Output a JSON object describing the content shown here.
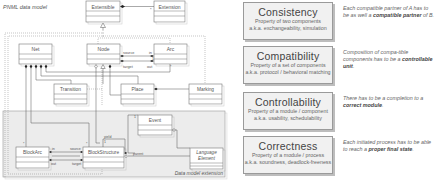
{
  "diagram": {
    "title": "PNML data model",
    "extension_label": "Data model extension",
    "classes": {
      "extensible": "Extensible",
      "extension": "Extension",
      "net": "Net",
      "node": "Node",
      "arc": "Arc",
      "transition": "Transition",
      "place": "Place",
      "marking": "Marking",
      "event": "Event",
      "block_arc": "BlockArc",
      "block_structure": "BlockStructure",
      "language_element_1": "Language",
      "language_element_2": "Element"
    },
    "roles": {
      "source": "source",
      "target": "target",
      "in": "in",
      "out": "out",
      "yield": "yield",
      "parent": "parent",
      "multiplicity": "*"
    }
  },
  "properties": [
    {
      "title": "Consistency",
      "line1": "Property of two components",
      "line2": "a.k.a. exchangeability, simulation",
      "note_pre": "Each compatible partner of A has to be as well a ",
      "note_bold": "compatible partner",
      "note_post": " of B."
    },
    {
      "title": "Compatibility",
      "line1": "Property of a set of components",
      "line2": "a.k.a. protocol / behavioral matching",
      "note_pre": "Composition of compa-tible components has to be a ",
      "note_bold": "controllable unit",
      "note_post": "."
    },
    {
      "title": "Controllability",
      "line1": "Property of a module / component",
      "line2": "a.k.a. usability, schedulability",
      "note_pre": "There has to be a completion to a ",
      "note_bold": "correct module",
      "note_post": "."
    },
    {
      "title": "Correctness",
      "line1": "Property of a module / process",
      "line2": "a.k.a. soundness, deadlock-freeness",
      "note_pre": "Each initiated process has to be able to reach a ",
      "note_bold": "proper final state",
      "note_post": "."
    }
  ]
}
